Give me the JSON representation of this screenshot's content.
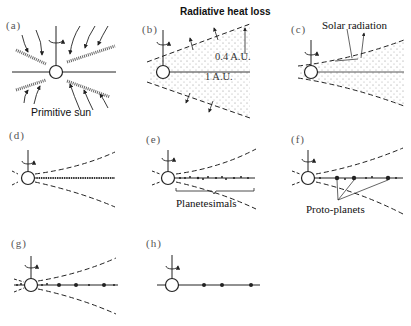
{
  "figure": {
    "panels": [
      {
        "id": "a",
        "label": "(a)",
        "caption": "Primitive sun"
      },
      {
        "id": "b",
        "label": "(b)",
        "caption": "Radiative heat loss",
        "annotations": [
          "0.4 A.U.",
          "1 A.U."
        ]
      },
      {
        "id": "c",
        "label": "(c)",
        "caption": "Solar radiation"
      },
      {
        "id": "d",
        "label": "(d)"
      },
      {
        "id": "e",
        "label": "(e)",
        "caption": "Planetesimals"
      },
      {
        "id": "f",
        "label": "(f)",
        "caption": "Proto-planets"
      },
      {
        "id": "g",
        "label": "(g)"
      },
      {
        "id": "h",
        "label": "(h)"
      }
    ]
  }
}
